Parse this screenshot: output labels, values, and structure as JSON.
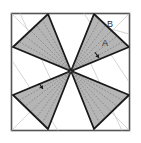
{
  "figure": {
    "frame": {
      "x": 11.5,
      "y": 13.5,
      "width": 118,
      "height": 117,
      "stroke_color": "#555555",
      "fill_color": "#ffffff",
      "stroke_width": 1.6
    },
    "center": {
      "x": 71,
      "y": 71
    },
    "colors": {
      "triangle_fill": "#b5b5b5",
      "triangle_stroke": "#1a1a1a",
      "guide_line": "#c9c9c9",
      "fan_dash": "#6f6f6f",
      "label": "#2b2b2b",
      "background": "#ffffff"
    },
    "triangles": [
      {
        "name": "upper-left-triangle",
        "points": "13,47 48,14 71,71",
        "apex": {
          "x": 71,
          "y": 71
        },
        "base": [
          {
            "x": 13,
            "y": 47
          },
          {
            "x": 48,
            "y": 14
          }
        ]
      },
      {
        "name": "upper-right-triangle",
        "points": "94,14 129,47 71,71",
        "apex": {
          "x": 71,
          "y": 71
        },
        "base": [
          {
            "x": 94,
            "y": 14
          },
          {
            "x": 129,
            "y": 47
          }
        ]
      },
      {
        "name": "lower-right-triangle",
        "points": "129,95 94,129 71,71",
        "apex": {
          "x": 71,
          "y": 71
        },
        "base": [
          {
            "x": 129,
            "y": 95
          },
          {
            "x": 94,
            "y": 129
          }
        ]
      },
      {
        "name": "lower-left-triangle",
        "points": "48,129 13,95 71,71",
        "apex": {
          "x": 71,
          "y": 71
        },
        "base": [
          {
            "x": 48,
            "y": 129
          },
          {
            "x": 13,
            "y": 95
          }
        ]
      }
    ],
    "labels": [
      {
        "name": "label-b",
        "text": "B",
        "x": 110,
        "y": 25
      },
      {
        "name": "label-a",
        "text": "A",
        "x": 105,
        "y": 44
      }
    ],
    "arrow_marks": [
      {
        "name": "arrow-mark-upper-right",
        "x": 99,
        "y": 58,
        "angle": 55
      },
      {
        "name": "arrow-mark-lower-left",
        "x": 43,
        "y": 89,
        "angle": 55
      }
    ],
    "guide_lines": [
      {
        "name": "guide-diagonal-top-left",
        "x1": 11.5,
        "y1": 13.5,
        "x2": 129.5,
        "y2": 130.5
      },
      {
        "name": "guide-diagonal-top-right",
        "x1": 129.5,
        "y1": 13.5,
        "x2": 11.5,
        "y2": 130.5
      },
      {
        "name": "guide-line-left-upper",
        "x1": 20,
        "y1": 13.5,
        "x2": 52,
        "y2": 82
      },
      {
        "name": "guide-line-left-lower",
        "x1": 13,
        "y1": 62,
        "x2": 58,
        "y2": 130.5
      },
      {
        "name": "guide-line-right-upper",
        "x1": 84,
        "y1": 13.5,
        "x2": 129,
        "y2": 82
      },
      {
        "name": "guide-line-right-lower",
        "x1": 90,
        "y1": 62,
        "x2": 122,
        "y2": 130.5
      },
      {
        "name": "guide-line-b-leader",
        "x1": 104,
        "y1": 27,
        "x2": 129,
        "y2": 34
      }
    ],
    "fan_lines": {
      "name": "fan-dash-lines",
      "rays_per_triangle": 5,
      "dash_pattern": "1.6 1.6",
      "note": "dashed rays from center apex to points along each triangle base"
    }
  }
}
